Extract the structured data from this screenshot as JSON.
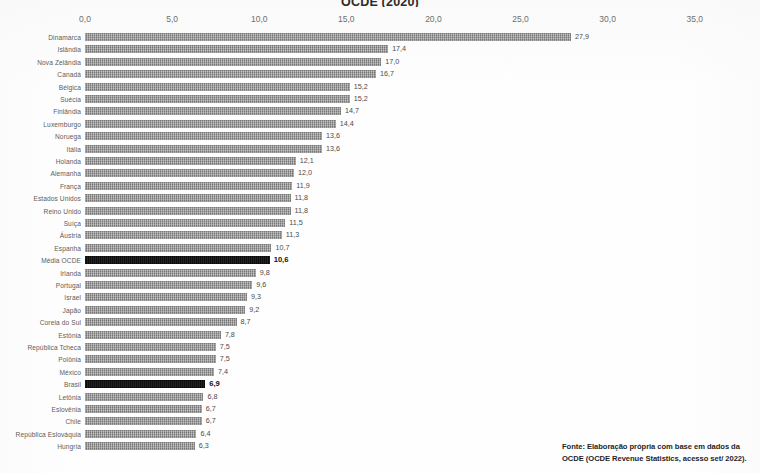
{
  "chart": {
    "title": "OCDE (2020)",
    "source_line_1": "Fonte:  Elaboração própria com base em dados da",
    "source_line_2": "OCDE (OCDE Revenue Statistics, acesso set/ 2022)."
  },
  "chart_data": {
    "type": "bar",
    "orientation": "horizontal",
    "title": "OCDE (2020)",
    "xlabel": "",
    "ylabel": "",
    "xlim": [
      0,
      35
    ],
    "grid": false,
    "legend": null,
    "tick_labels": [
      "0,0",
      "5,0",
      "10,0",
      "15,0",
      "20,0",
      "25,0",
      "30,0",
      "35,0"
    ],
    "ticks": [
      0,
      5,
      10,
      15,
      20,
      25,
      30,
      35
    ],
    "highlight_color": "#131313",
    "bar_color": "#8d8d8d",
    "categories": [
      "Dinamarca",
      "Islândia",
      "Nova Zelândia",
      "Canadá",
      "Bélgica",
      "Suécia",
      "Finlândia",
      "Luxemburgo",
      "Noruega",
      "Itália",
      "Holanda",
      "Alemanha",
      "França",
      "Estados Unidos",
      "Reino Unido",
      "Suíça",
      "Áustria",
      "Espanha",
      "Média OCDE",
      "Irlanda",
      "Portugal",
      "Israel",
      "Japão",
      "Coreia do Sul",
      "Estônia",
      "República Tcheca",
      "Polônia",
      "México",
      "Brasil",
      "Letônia",
      "Eslovênia",
      "Chile",
      "República Eslováquia",
      "Hungria"
    ],
    "values": [
      27.9,
      17.4,
      17.0,
      16.7,
      15.2,
      15.2,
      14.7,
      14.4,
      13.6,
      13.6,
      12.1,
      12.0,
      11.9,
      11.8,
      11.8,
      11.5,
      11.3,
      10.7,
      10.6,
      9.8,
      9.6,
      9.3,
      9.2,
      8.7,
      7.8,
      7.5,
      7.5,
      7.4,
      6.9,
      6.8,
      6.7,
      6.7,
      6.4,
      6.3
    ],
    "value_labels": [
      "27,9",
      "17,4",
      "17,0",
      "16,7",
      "15,2",
      "15,2",
      "14,7",
      "14,4",
      "13,6",
      "13,6",
      "12,1",
      "12,0",
      "11,9",
      "11,8",
      "11,8",
      "11,5",
      "11,3",
      "10,7",
      "10,6",
      "9,8",
      "9,6",
      "9,3",
      "9,2",
      "8,7",
      "7,8",
      "7,5",
      "7,5",
      "7,4",
      "6,9",
      "6,8",
      "6,7",
      "6,7",
      "6,4",
      "6,3"
    ],
    "highlighted": [
      false,
      false,
      false,
      false,
      false,
      false,
      false,
      false,
      false,
      false,
      false,
      false,
      false,
      false,
      false,
      false,
      false,
      false,
      true,
      false,
      false,
      false,
      false,
      false,
      false,
      false,
      false,
      false,
      true,
      false,
      false,
      false,
      false,
      false
    ]
  }
}
